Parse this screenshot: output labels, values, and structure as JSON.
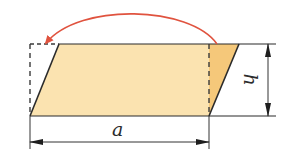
{
  "diagram": {
    "title": "",
    "labels": {
      "base": "a",
      "height": "h"
    },
    "colors": {
      "fill_main": "#fbe3b0",
      "fill_moved_triangle": "#f5c87a",
      "outline": "#2b2b2b",
      "dashed": "#3a3a3a",
      "arrow": "#e0533f",
      "dimension": "#333333"
    },
    "shapes": {
      "parallelogram": [
        [
          59,
          44
        ],
        [
          239,
          44
        ],
        [
          209,
          116
        ],
        [
          30,
          116
        ]
      ],
      "moved_triangle": [
        [
          209,
          44
        ],
        [
          239,
          44
        ],
        [
          209,
          116
        ]
      ],
      "dashed_rectangle_left_edge": [
        [
          30,
          44
        ],
        [
          30,
          116
        ]
      ],
      "dashed_rectangle_top_edge": [
        [
          30,
          44
        ],
        [
          59,
          44
        ]
      ],
      "dashed_cut_line": [
        [
          209,
          44
        ],
        [
          209,
          116
        ]
      ]
    },
    "dimensions": {
      "base_arrow": {
        "from": [
          30,
          142
        ],
        "to": [
          209,
          142
        ]
      },
      "height_arrow": {
        "from": [
          268,
          44
        ],
        "to": [
          268,
          116
        ]
      }
    },
    "transform_arrow": {
      "description": "curved red arrow moving triangle from right side to left side",
      "start": [
        217,
        44
      ],
      "peak": [
        130,
        12
      ],
      "end": [
        47,
        44
      ]
    }
  }
}
